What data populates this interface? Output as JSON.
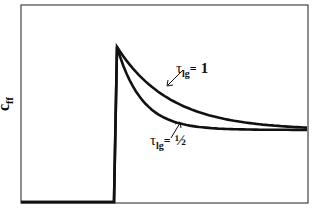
{
  "chart_data": {
    "type": "line",
    "title": "",
    "xlabel": "",
    "ylabel": "c_ff",
    "ylabel_main": "c",
    "ylabel_sub": "ff",
    "grid": false,
    "axis_ticks": false,
    "x": [
      0,
      0.3,
      0.31,
      0.4,
      0.5,
      0.6,
      0.7,
      0.8,
      0.9,
      1.0
    ],
    "series": [
      {
        "name": "tau_lg = 1",
        "label_symbol": "τ",
        "label_sub": "lg",
        "label_eq": "=",
        "label_value": "1",
        "description": "step at t0 then slow exponential decay to steady state",
        "values": [
          0,
          0,
          1.0,
          0.77,
          0.62,
          0.54,
          0.5,
          0.48,
          0.47,
          0.465
        ]
      },
      {
        "name": "tau_lg = 1/2",
        "label_symbol": "τ",
        "label_sub": "lg",
        "label_eq": "=",
        "label_value": "½",
        "description": "step at t0 then fast exponential decay to steady state",
        "values": [
          0,
          0,
          1.0,
          0.6,
          0.49,
          0.47,
          0.465,
          0.465,
          0.465,
          0.465
        ]
      }
    ],
    "steady_state": 0.465,
    "peak": 1.0,
    "step_time": 0.3,
    "ylim": [
      0,
      1.1
    ],
    "xlim": [
      0,
      1.0
    ]
  },
  "colors": {
    "line": "#111111",
    "frame": "#444444",
    "background": "#ffffff"
  }
}
